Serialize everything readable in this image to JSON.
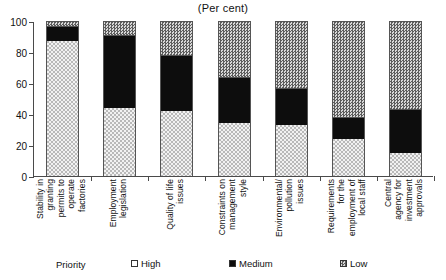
{
  "chart_data": {
    "type": "bar",
    "subtype": "stacked-bar-100",
    "title": "(Per cent)",
    "xlabel": "",
    "ylabel": "",
    "ylim": [
      0,
      100
    ],
    "yticks": [
      0,
      20,
      40,
      60,
      80,
      100
    ],
    "ytick_labels": [
      "0",
      "20",
      "40",
      "60",
      "80",
      "100"
    ],
    "grid": false,
    "legend_position": "bottom",
    "legend_title": "Priority",
    "categories": [
      "Stability in granting permits to operate factories",
      "Employment legislation",
      "Quality of life issues",
      "Constraints on management style",
      "Environmental/ pollution issues",
      "Requirements for the employment of local staff",
      "Central agency for investment approvals"
    ],
    "category_lines": [
      [
        "Stability in",
        "granting",
        "permits to",
        "operate",
        "factories"
      ],
      [
        "Employment",
        "legislation"
      ],
      [
        "Quality of life",
        "issues"
      ],
      [
        "Constraints on",
        "management",
        "style"
      ],
      [
        "Environmental/",
        "pollution",
        "issues"
      ],
      [
        "Requirements",
        "for the",
        "employment of",
        "local staff"
      ],
      [
        "Central",
        "agency for",
        "investment",
        "approvals"
      ]
    ],
    "series": [
      {
        "name": "High",
        "fill": "light-dotted",
        "values": [
          87,
          44,
          42,
          34,
          33,
          24,
          15
        ]
      },
      {
        "name": "Medium",
        "fill": "solid-black",
        "values": [
          10,
          47,
          36,
          30,
          24,
          14,
          28
        ]
      },
      {
        "name": "Low",
        "fill": "dark-hatch",
        "values": [
          3,
          9,
          22,
          36,
          43,
          62,
          57
        ]
      }
    ]
  },
  "legend": {
    "title": "Priority",
    "items": [
      {
        "label": "High"
      },
      {
        "label": "Medium"
      },
      {
        "label": "Low"
      }
    ]
  }
}
